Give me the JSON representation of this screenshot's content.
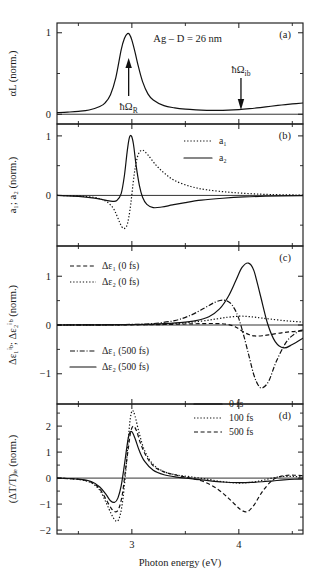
{
  "figure": {
    "title_annotation": "Ag – D = 26 nm",
    "xaxis": {
      "label": "Photon energy (eV)",
      "range": [
        2.3,
        4.6
      ],
      "major_ticks": [
        3,
        4
      ],
      "major_tick_labels": [
        "3",
        "4"
      ],
      "minor_ticks": [
        2.5,
        3.5,
        4.5
      ]
    },
    "panels": [
      {
        "tag": "(a)",
        "ylabel": "αL (norm.)",
        "ylim": [
          -0.12,
          1.12
        ],
        "major_ticks": [
          0,
          1
        ],
        "major_tick_labels": [
          "0",
          "1"
        ],
        "minor_ticks": [
          0.5
        ],
        "annotations": [
          {
            "name": "resonance-arrow-label",
            "text": "ħΩ",
            "sub": "R",
            "x": 2.97,
            "direction": "up"
          },
          {
            "name": "interband-arrow-label",
            "text": "ħΩ",
            "sub": "ib",
            "x": 4.02,
            "direction": "down"
          }
        ]
      },
      {
        "tag": "(b)",
        "ylabel": "a₁; a₂ (norm.)",
        "ylim": [
          -0.85,
          1.2
        ],
        "major_ticks": [
          0,
          1
        ],
        "major_tick_labels": [
          "0",
          "1"
        ],
        "minor_ticks": [
          -0.5,
          0.5
        ],
        "legend": [
          {
            "label": "a₁",
            "style": "dotted"
          },
          {
            "label": "a₂",
            "style": "solid"
          }
        ]
      },
      {
        "tag": "(c)",
        "ylabel": "Δε₁ⁱᵇ; Δε₂ⁱᵇ (norm.)",
        "ylim": [
          -1.62,
          1.62
        ],
        "major_ticks": [
          -1,
          0,
          1
        ],
        "major_tick_labels": [
          "−1",
          "0",
          "1"
        ],
        "minor_ticks": [
          -0.5,
          0.5
        ],
        "legend_upper": [
          {
            "label": "Δε₁ (0 fs)",
            "style": "dashed"
          },
          {
            "label": "Δε₂ (0 fs)",
            "style": "dotted"
          }
        ],
        "legend_lower": [
          {
            "label": "Δε₁ (500 fs)",
            "style": "dashdot"
          },
          {
            "label": "Δε₂ (500 fs)",
            "style": "solid"
          }
        ]
      },
      {
        "tag": "(d)",
        "ylabel": "(ΔT/T)ᵢₑ (norm.)",
        "ylim": [
          -2.15,
          2.85
        ],
        "major_ticks": [
          -2,
          -1,
          0,
          1,
          2
        ],
        "major_tick_labels": [
          "−2",
          "−1",
          "0",
          "1",
          "2"
        ],
        "minor_ticks": [
          -1.5,
          -0.5,
          0.5,
          1.5,
          2.5
        ],
        "legend": [
          {
            "label": "0 fs",
            "style": "solid"
          },
          {
            "label": "100 fs",
            "style": "dotted"
          },
          {
            "label": "500 fs",
            "style": "dashed"
          }
        ]
      }
    ]
  },
  "chart_data": {
    "type": "line",
    "title": "Ag – D = 26 nm",
    "xlabel": "Photon energy (eV)",
    "xlim": [
      2.3,
      4.6
    ],
    "grid": false,
    "subplots": [
      {
        "panel": "(a)",
        "ylabel": "αL (norm.)",
        "ylim": [
          -0.12,
          1.12
        ],
        "legend_position": "none",
        "series": [
          {
            "name": "αL",
            "style": "solid",
            "x": [
              2.3,
              2.4,
              2.5,
              2.6,
              2.7,
              2.75,
              2.8,
              2.85,
              2.9,
              2.93,
              2.96,
              2.98,
              3.0,
              3.03,
              3.06,
              3.1,
              3.15,
              3.2,
              3.3,
              3.4,
              3.5,
              3.6,
              3.7,
              3.8,
              3.9,
              4.0,
              4.1,
              4.2,
              4.3,
              4.4,
              4.5,
              4.6
            ],
            "y": [
              0.02,
              0.026,
              0.035,
              0.052,
              0.095,
              0.14,
              0.24,
              0.45,
              0.79,
              0.93,
              0.99,
              0.975,
              0.91,
              0.76,
              0.59,
              0.4,
              0.25,
              0.175,
              0.105,
              0.078,
              0.062,
              0.053,
              0.048,
              0.047,
              0.05,
              0.057,
              0.068,
              0.082,
              0.098,
              0.113,
              0.126,
              0.138
            ]
          }
        ]
      },
      {
        "panel": "(b)",
        "ylabel": "a₁; a₂ (norm.)",
        "ylim": [
          -0.85,
          1.2
        ],
        "legend_position": "upper right",
        "series": [
          {
            "name": "a₁",
            "style": "dotted",
            "x": [
              2.3,
              2.5,
              2.65,
              2.75,
              2.82,
              2.86,
              2.89,
              2.92,
              2.95,
              2.97,
              2.99,
              3.01,
              3.03,
              3.06,
              3.1,
              3.15,
              3.22,
              3.3,
              3.4,
              3.55,
              3.7,
              3.9,
              4.1,
              4.3,
              4.6
            ],
            "y": [
              0.0,
              -0.01,
              -0.035,
              -0.09,
              -0.2,
              -0.34,
              -0.47,
              -0.555,
              -0.52,
              -0.38,
              -0.14,
              0.18,
              0.45,
              0.69,
              0.76,
              0.68,
              0.52,
              0.38,
              0.25,
              0.15,
              0.095,
              0.055,
              0.03,
              0.015,
              0.005
            ]
          },
          {
            "name": "a₂",
            "style": "solid",
            "x": [
              2.3,
              2.5,
              2.65,
              2.75,
              2.82,
              2.86,
              2.9,
              2.93,
              2.955,
              2.975,
              2.995,
              3.015,
              3.04,
              3.07,
              3.1,
              3.14,
              3.2,
              3.28,
              3.38,
              3.5,
              3.65,
              3.85,
              4.05,
              4.25,
              4.6
            ],
            "y": [
              0.0,
              -0.015,
              -0.045,
              -0.08,
              -0.1,
              -0.085,
              0.03,
              0.33,
              0.72,
              0.96,
              1.0,
              0.86,
              0.5,
              0.17,
              -0.03,
              -0.15,
              -0.205,
              -0.195,
              -0.16,
              -0.12,
              -0.08,
              -0.048,
              -0.026,
              -0.014,
              -0.004
            ]
          }
        ]
      },
      {
        "panel": "(c)",
        "ylabel": "Δε₁ⁱᵇ; Δε₂ⁱᵇ (norm.)",
        "ylim": [
          -1.62,
          1.62
        ],
        "legend_position": "left",
        "series": [
          {
            "name": "Δε₁ (0 fs)",
            "style": "dashed",
            "x": [
              2.3,
              2.8,
              3.1,
              3.3,
              3.5,
              3.65,
              3.78,
              3.88,
              3.95,
              4.0,
              4.05,
              4.1,
              4.15,
              4.22,
              4.3,
              4.4,
              4.5,
              4.6
            ],
            "y": [
              0.0,
              0.002,
              0.005,
              0.01,
              0.02,
              0.028,
              0.03,
              0.018,
              -0.02,
              -0.08,
              -0.15,
              -0.2,
              -0.225,
              -0.22,
              -0.195,
              -0.16,
              -0.135,
              -0.12
            ]
          },
          {
            "name": "Δε₂ (0 fs)",
            "style": "dotted",
            "x": [
              2.3,
              2.8,
              3.1,
              3.3,
              3.5,
              3.65,
              3.78,
              3.9,
              4.0,
              4.08,
              4.15,
              4.22,
              4.3,
              4.4,
              4.5,
              4.6
            ],
            "y": [
              0.0,
              0.003,
              0.008,
              0.018,
              0.045,
              0.08,
              0.12,
              0.16,
              0.18,
              0.175,
              0.16,
              0.14,
              0.12,
              0.095,
              0.075,
              0.06
            ]
          },
          {
            "name": "Δε₁ (500 fs)",
            "style": "dashdot",
            "x": [
              2.3,
              2.7,
              3.0,
              3.2,
              3.4,
              3.55,
              3.68,
              3.78,
              3.86,
              3.92,
              3.96,
              4.0,
              4.05,
              4.1,
              4.14,
              4.18,
              4.22,
              4.28,
              4.35,
              4.45,
              4.55,
              4.6
            ],
            "y": [
              0.0,
              0.004,
              0.012,
              0.03,
              0.09,
              0.2,
              0.35,
              0.47,
              0.51,
              0.45,
              0.33,
              0.13,
              -0.25,
              -0.68,
              -1.02,
              -1.23,
              -1.29,
              -1.15,
              -0.75,
              -0.33,
              -0.14,
              -0.1
            ]
          },
          {
            "name": "Δε₂ (500 fs)",
            "style": "solid",
            "x": [
              2.3,
              2.7,
              3.0,
              3.25,
              3.45,
              3.6,
              3.72,
              3.82,
              3.9,
              3.97,
              4.03,
              4.09,
              4.14,
              4.2,
              4.27,
              4.34,
              4.42,
              4.5,
              4.6
            ],
            "y": [
              0.0,
              0.003,
              0.01,
              0.025,
              0.05,
              0.09,
              0.17,
              0.33,
              0.58,
              0.9,
              1.18,
              1.27,
              1.12,
              0.62,
              0.02,
              -0.34,
              -0.47,
              -0.4,
              -0.27
            ]
          }
        ]
      },
      {
        "panel": "(d)",
        "ylabel": "(ΔT/T)ᵢₑ (norm.)",
        "ylim": [
          -2.15,
          2.85
        ],
        "legend_position": "upper right",
        "series": [
          {
            "name": "0 fs",
            "style": "solid",
            "x": [
              2.3,
              2.5,
              2.62,
              2.7,
              2.76,
              2.8,
              2.84,
              2.87,
              2.9,
              2.93,
              2.955,
              2.975,
              3.0,
              3.03,
              3.07,
              3.12,
              3.2,
              3.3,
              3.42,
              3.55,
              3.7,
              3.85,
              4.0,
              4.12,
              4.22,
              4.32,
              4.42,
              4.52,
              4.6
            ],
            "y": [
              0.0,
              -0.04,
              -0.13,
              -0.34,
              -0.64,
              -0.87,
              -0.93,
              -0.76,
              -0.3,
              0.5,
              1.25,
              1.7,
              1.78,
              1.52,
              1.05,
              0.64,
              0.3,
              0.13,
              0.04,
              -0.02,
              -0.09,
              -0.15,
              -0.175,
              -0.165,
              -0.14,
              -0.105,
              -0.07,
              -0.045,
              -0.035
            ]
          },
          {
            "name": "100 fs",
            "style": "dotted",
            "x": [
              2.3,
              2.5,
              2.62,
              2.7,
              2.76,
              2.81,
              2.85,
              2.88,
              2.91,
              2.94,
              2.965,
              2.985,
              3.005,
              3.03,
              3.07,
              3.12,
              3.2,
              3.3,
              3.42,
              3.55,
              3.7,
              3.85,
              4.0,
              4.12,
              4.22,
              4.32,
              4.42,
              4.52,
              4.6
            ],
            "y": [
              0.0,
              -0.05,
              -0.18,
              -0.47,
              -0.95,
              -1.4,
              -1.65,
              -1.56,
              -1.0,
              0.15,
              1.4,
              2.28,
              2.6,
              2.38,
              1.7,
              1.05,
              0.52,
              0.25,
              0.12,
              0.05,
              -0.04,
              -0.14,
              -0.19,
              -0.16,
              -0.09,
              0.01,
              0.065,
              0.06,
              0.04
            ]
          },
          {
            "name": "500 fs",
            "style": "dashed",
            "x": [
              2.3,
              2.5,
              2.62,
              2.7,
              2.76,
              2.81,
              2.85,
              2.88,
              2.91,
              2.94,
              2.97,
              2.99,
              3.015,
              3.045,
              3.08,
              3.13,
              3.2,
              3.3,
              3.42,
              3.55,
              3.68,
              3.8,
              3.9,
              3.98,
              4.03,
              4.08,
              4.14,
              4.22,
              4.32,
              4.42,
              4.52,
              4.6
            ],
            "y": [
              0.0,
              -0.045,
              -0.16,
              -0.42,
              -0.83,
              -1.18,
              -1.3,
              -1.15,
              -0.65,
              0.3,
              1.25,
              1.8,
              2.0,
              1.8,
              1.35,
              0.88,
              0.47,
              0.24,
              0.11,
              0.0,
              -0.15,
              -0.42,
              -0.76,
              -1.08,
              -1.25,
              -1.29,
              -1.05,
              -0.52,
              -0.06,
              0.09,
              0.11,
              0.09
            ]
          }
        ]
      }
    ]
  }
}
